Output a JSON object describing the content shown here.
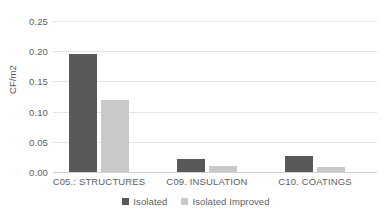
{
  "chart_data": {
    "type": "bar",
    "title": "",
    "xlabel": "",
    "ylabel": "CF/m2",
    "categories": [
      "C05.: STRUCTURES",
      "C09. INSULATION",
      "C10. COATINGS"
    ],
    "series": [
      {
        "name": "Isolated",
        "color": "#595959",
        "values": [
          0.196,
          0.021,
          0.026
        ]
      },
      {
        "name": "Isolated Improved",
        "color": "#c9c9c9",
        "values": [
          0.119,
          0.01,
          0.009
        ]
      }
    ],
    "ylim": [
      0.0,
      0.25
    ],
    "yticks": [
      0.0,
      0.05,
      0.1,
      0.15,
      0.2,
      0.25
    ],
    "ytick_labels": [
      "0.00",
      "0.05",
      "0.10",
      "0.15",
      "0.20",
      "0.25"
    ],
    "grid": true,
    "legend_position": "bottom"
  }
}
